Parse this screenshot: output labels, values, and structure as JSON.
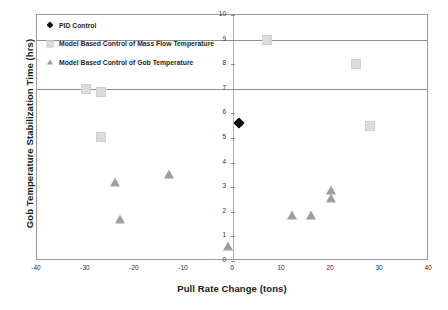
{
  "chart_data": {
    "type": "scatter",
    "title": "",
    "xlabel": "Pull Rate Change (tons)",
    "ylabel": "Gob Temperature Stabilization Time (hrs)",
    "xlim": [
      -40,
      40
    ],
    "ylim": [
      0,
      10
    ],
    "xticks": [
      "-40",
      "-30",
      "-20",
      "-10",
      "0",
      "10",
      "20",
      "30",
      "40"
    ],
    "yticks": [
      "0",
      "1",
      "2",
      "3",
      "4",
      "5",
      "6",
      "7",
      "8",
      "9",
      "10"
    ],
    "grid": "horizontal gridlines at y=7 and y=9; vertical y-axis drawn at x=0",
    "gridlines_y": [
      7,
      9
    ],
    "legend_position": "top-left inside plot area",
    "series": [
      {
        "name": "PID Control",
        "marker": "diamond",
        "color": "#111111",
        "points": [
          [
            2,
            5.45
          ]
        ]
      },
      {
        "name": "Model Based Control of Mass Flow Temperature",
        "marker": "square",
        "color": "#dcdcdc",
        "points": [
          [
            -30,
            7.0
          ],
          [
            -27,
            6.85
          ],
          [
            -27,
            5.05
          ],
          [
            7,
            9.0
          ],
          [
            25,
            8.0
          ],
          [
            28,
            5.5
          ]
        ]
      },
      {
        "name": "Model Based Control of Gob Temperature",
        "marker": "triangle",
        "color": "#9e9e9e",
        "points": [
          [
            -24,
            3.2
          ],
          [
            -23,
            1.7
          ],
          [
            -13,
            3.55
          ],
          [
            -1,
            0.6
          ],
          [
            12,
            1.85
          ],
          [
            16,
            1.85
          ],
          [
            20,
            2.9
          ],
          [
            20,
            2.55
          ]
        ]
      }
    ]
  }
}
